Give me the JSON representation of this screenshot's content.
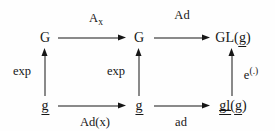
{
  "diagram": {
    "kind": "commutative-diagram",
    "background_color": "#fefefe",
    "ink_color": "#161616",
    "nodes": {
      "top_left": "G",
      "top_middle": "G",
      "top_right_prefix": "GL(",
      "top_right_arg": "g",
      "top_right_suffix": ")",
      "bottom_left": "g",
      "bottom_middle": "g",
      "bottom_right_op": "gl",
      "bottom_right_open": "(",
      "bottom_right_arg": "g",
      "bottom_right_close": ")"
    },
    "arrows": {
      "top_left_label_base": "A",
      "top_left_label_sub": "x",
      "top_right_label": "Ad",
      "bottom_left_label": "Ad(x)",
      "bottom_right_label": "ad",
      "vertical_left_label": "exp",
      "vertical_middle_label": "exp",
      "vertical_right_label_base": "e",
      "vertical_right_label_sup": "(.)"
    }
  }
}
